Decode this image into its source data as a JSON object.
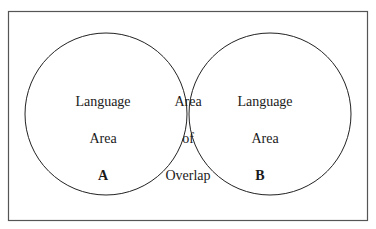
{
  "diagram": {
    "type": "venn",
    "frame": {
      "x": 8,
      "y": 11,
      "width": 360,
      "height": 210,
      "stroke": "#555555"
    },
    "circles": [
      {
        "id": "A",
        "cx": 106,
        "cy": 114,
        "r": 82
      },
      {
        "id": "B",
        "cx": 270,
        "cy": 114,
        "r": 82
      }
    ],
    "left": {
      "line1": "Language",
      "line2": "Area",
      "letter": "A"
    },
    "overlap": {
      "line1": "Area",
      "line2": "of",
      "line3": "Overlap"
    },
    "right": {
      "line1": "Language",
      "line2": "Area",
      "letter": "B"
    }
  }
}
